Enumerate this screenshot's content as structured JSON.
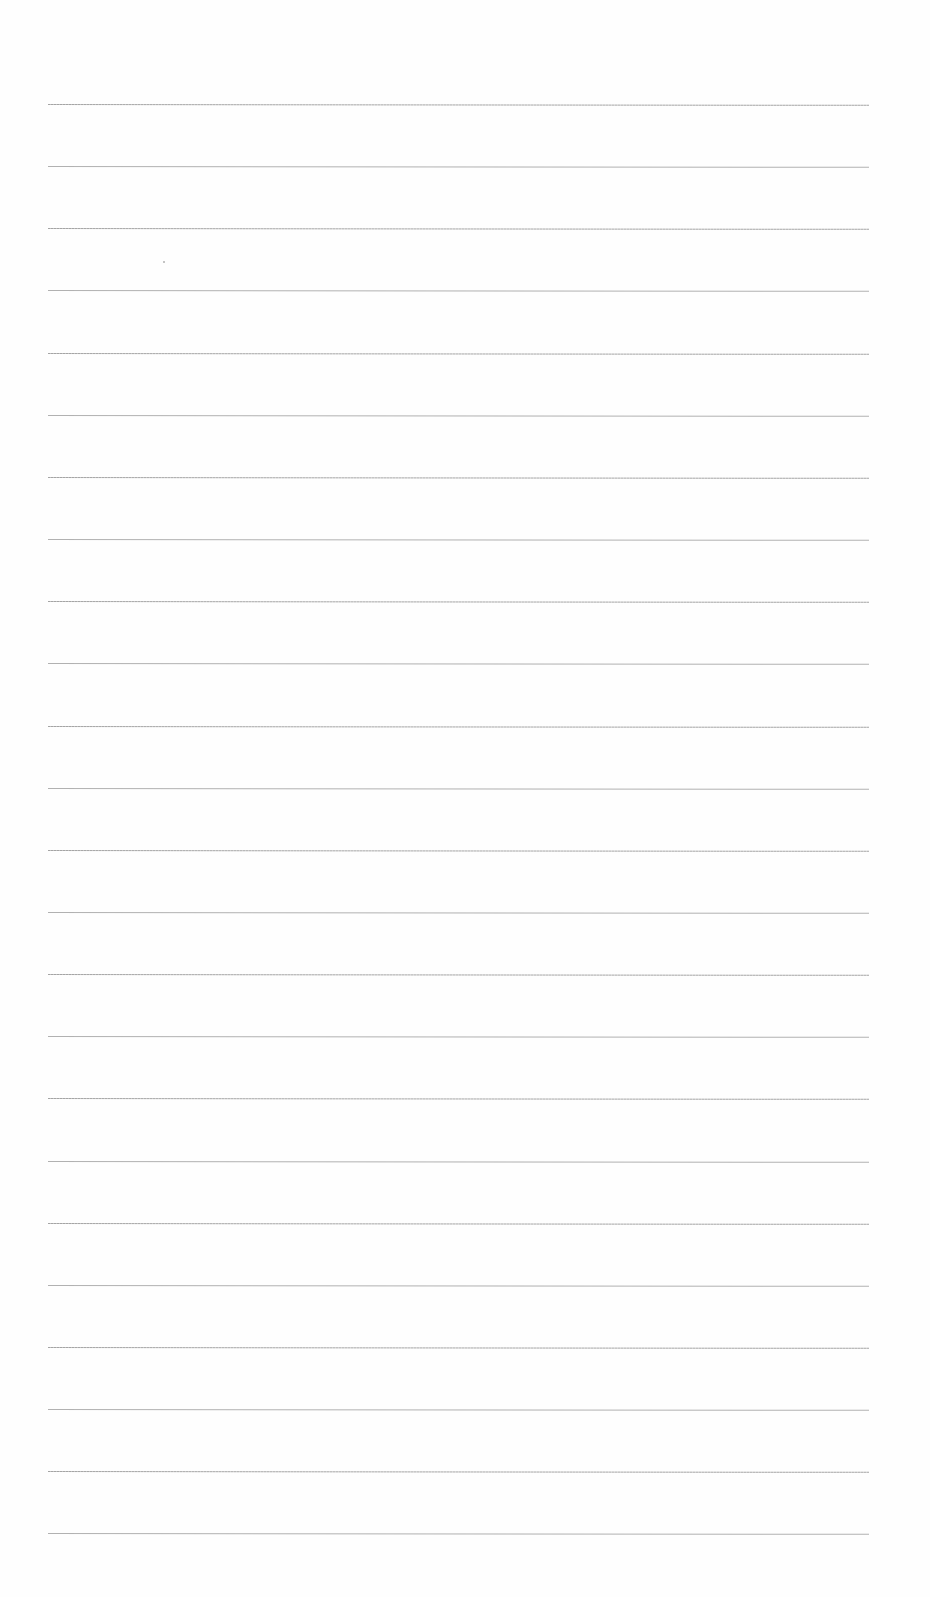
{
  "document": {
    "type": "lined-paper",
    "text_content": "",
    "line_count": 24,
    "first_line_y": 104,
    "line_spacing": 62.15,
    "line_left": 48,
    "line_width": 821,
    "line_color": "#a8a8a8",
    "background_color": "#fefefe"
  }
}
